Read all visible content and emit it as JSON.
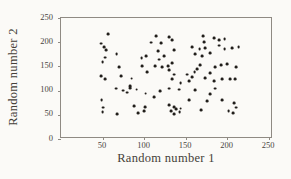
{
  "figure": {
    "background_color": "#fbfaf7",
    "frame_color": "#8f8a83",
    "text_color": "#4a443e",
    "dot_color": "#211e1b"
  },
  "chart_data": {
    "type": "scatter",
    "title": "",
    "xlabel": "Random number 1",
    "ylabel": "Random number 2",
    "xlim": [
      0,
      250
    ],
    "ylim": [
      0,
      250
    ],
    "x_ticks": [
      50,
      100,
      150,
      200,
      250
    ],
    "y_ticks": [
      0,
      50,
      100,
      150,
      200,
      250
    ],
    "grid": false,
    "legend": false,
    "points": [
      [
        57,
        216
      ],
      [
        48,
        197
      ],
      [
        52,
        190
      ],
      [
        54,
        184
      ],
      [
        67,
        176
      ],
      [
        53,
        168
      ],
      [
        50,
        159
      ],
      [
        70,
        149
      ],
      [
        72,
        130
      ],
      [
        48,
        130
      ],
      [
        53,
        123
      ],
      [
        66,
        104
      ],
      [
        75,
        100
      ],
      [
        80,
        96
      ],
      [
        83,
        105
      ],
      [
        49,
        80
      ],
      [
        51,
        65
      ],
      [
        50,
        56
      ],
      [
        68,
        52
      ],
      [
        85,
        125
      ],
      [
        83,
        110
      ],
      [
        91,
        102
      ],
      [
        93,
        54
      ],
      [
        100,
        58
      ],
      [
        101,
        66
      ],
      [
        88,
        68
      ],
      [
        98,
        150
      ],
      [
        104,
        139
      ],
      [
        112,
        87
      ],
      [
        102,
        94
      ],
      [
        109,
        199
      ],
      [
        115,
        213
      ],
      [
        117,
        182
      ],
      [
        113,
        151
      ],
      [
        119,
        99
      ],
      [
        97,
        167
      ],
      [
        103,
        172
      ],
      [
        121,
        198
      ],
      [
        124,
        171
      ],
      [
        118,
        164
      ],
      [
        130,
        211
      ],
      [
        134,
        204
      ],
      [
        136,
        184
      ],
      [
        129,
        150
      ],
      [
        122,
        149
      ],
      [
        134,
        156
      ],
      [
        130,
        143
      ],
      [
        136,
        133
      ],
      [
        134,
        123
      ],
      [
        152,
        133
      ],
      [
        130,
        104
      ],
      [
        144,
        116
      ],
      [
        142,
        102
      ],
      [
        154,
        119
      ],
      [
        154,
        80
      ],
      [
        130,
        70
      ],
      [
        136,
        66
      ],
      [
        133,
        58
      ],
      [
        139,
        61
      ],
      [
        136,
        52
      ],
      [
        143,
        55
      ],
      [
        144,
        63
      ],
      [
        158,
        190
      ],
      [
        167,
        186
      ],
      [
        174,
        187
      ],
      [
        162,
        176
      ],
      [
        170,
        172
      ],
      [
        164,
        145
      ],
      [
        168,
        152
      ],
      [
        161,
        138
      ],
      [
        158,
        128
      ],
      [
        171,
        213
      ],
      [
        172,
        200
      ],
      [
        184,
        208
      ],
      [
        190,
        204
      ],
      [
        197,
        206
      ],
      [
        190,
        193
      ],
      [
        197,
        186
      ],
      [
        206,
        187
      ],
      [
        214,
        190
      ],
      [
        180,
        178
      ],
      [
        186,
        149
      ],
      [
        193,
        152
      ],
      [
        200,
        154
      ],
      [
        211,
        148
      ],
      [
        180,
        136
      ],
      [
        184,
        119
      ],
      [
        174,
        126
      ],
      [
        194,
        124
      ],
      [
        204,
        123
      ],
      [
        210,
        124
      ],
      [
        176,
        79
      ],
      [
        180,
        93
      ],
      [
        186,
        104
      ],
      [
        194,
        80
      ],
      [
        169,
        60
      ],
      [
        162,
        101
      ],
      [
        209,
        74
      ],
      [
        211,
        65
      ],
      [
        202,
        57
      ],
      [
        207,
        54
      ]
    ]
  }
}
